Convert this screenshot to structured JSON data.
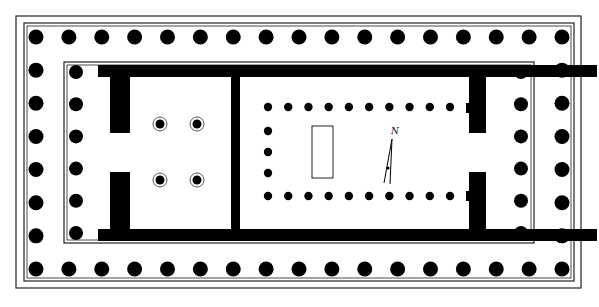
{
  "diagram": {
    "colors": {
      "background": "#ffffff",
      "ink": "#000000",
      "line": "#222222"
    },
    "outer_border": {
      "outer": [
        16,
        16,
        581,
        288
      ],
      "inner": [
        24,
        23,
        574,
        281
      ]
    },
    "stylobate_inner": [
      64,
      62,
      534,
      243
    ],
    "peristyle": {
      "label": "peristyle",
      "count_long_side": 17,
      "count_short_side": 8,
      "x_start": 36,
      "x_end": 562,
      "y_start": 37,
      "y_end": 269,
      "radius": 7.5
    },
    "porches": [
      {
        "label": "pronaos columns",
        "x": 76,
        "y_start": 72,
        "y_end": 233,
        "count": 6,
        "radius": 7
      },
      {
        "label": "opisthodomos columns",
        "x": 521,
        "y_start": 72,
        "y_end": 233,
        "count": 6,
        "radius": 7
      }
    ],
    "walls": [
      {
        "label": "north wall",
        "rect": [
          98,
          65,
          499,
          12
        ]
      },
      {
        "label": "south wall",
        "rect": [
          98,
          229,
          499,
          12
        ]
      },
      {
        "label": "west wall upper",
        "rect": [
          110,
          65,
          20,
          68
        ]
      },
      {
        "label": "west wall lower",
        "rect": [
          110,
          172,
          20,
          69
        ]
      },
      {
        "label": "cross wall",
        "rect": [
          231,
          65,
          9,
          176
        ]
      },
      {
        "label": "east wall upper",
        "rect": [
          469,
          65,
          17,
          68
        ]
      },
      {
        "label": "east wall lower",
        "rect": [
          469,
          172,
          17,
          69
        ]
      }
    ],
    "back_room_columns": {
      "label": "four ringed columns",
      "positions": [
        [
          160,
          124
        ],
        [
          197,
          124
        ],
        [
          160,
          180
        ],
        [
          197,
          180
        ]
      ],
      "radius": 4.5,
      "ring_radius": 7
    },
    "cella_colonnade": {
      "label": "interior colonnade",
      "top_row": {
        "y": 107,
        "x_start": 268,
        "x_end": 450,
        "count": 10
      },
      "bottom_row": {
        "y": 196,
        "x_start": 268,
        "x_end": 450,
        "count": 10
      },
      "end_row": {
        "x": 268,
        "ys": [
          131,
          152,
          173
        ]
      },
      "radius": 4.2
    },
    "statue_base": {
      "label": "statue base",
      "rect": [
        312,
        126,
        21,
        52
      ]
    },
    "north_arrow": {
      "label": "N",
      "text_pos": [
        395,
        134
      ],
      "shaft": [
        [
          392,
          139
        ],
        [
          384,
          183
        ]
      ],
      "shaft2": [
        [
          392,
          139
        ],
        [
          390,
          184
        ]
      ]
    }
  }
}
